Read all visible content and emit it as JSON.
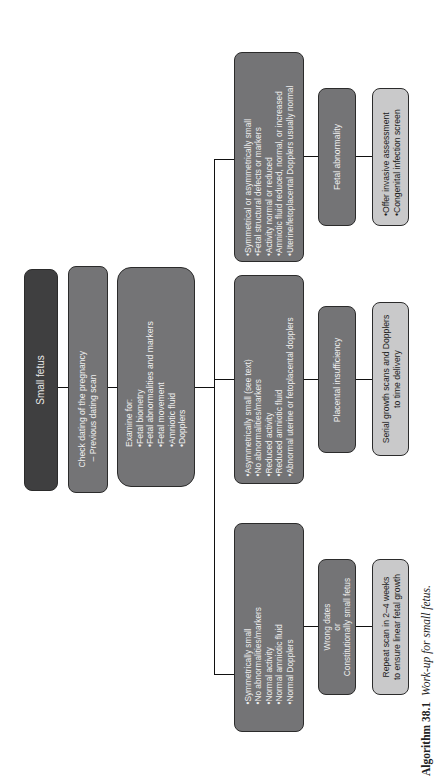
{
  "diagram": {
    "root": {
      "label": "Small fetus"
    },
    "step_check": {
      "title": "Check dating of the pregnancy",
      "detail": "– Previous dating scan"
    },
    "step_examine": {
      "title": "Examine for:",
      "items": [
        "Fetal biometry",
        "Fetal abnormalities and markers",
        "Fetal movement",
        "Amniotic fluid",
        "Dopplers"
      ]
    },
    "branches": [
      {
        "findings": [
          "Symmetrical or asymmetrically small",
          "Fetal structural defects or markers",
          "Activity normal or reduced",
          "Amniotic fluid reduced, normal, or increased",
          "Uterine/fetoplacental Dopplers usually normal"
        ],
        "diagnosis": {
          "line1": "Fetal abnormality",
          "line2": "",
          "line3": ""
        },
        "action": {
          "items": [
            "Offer invasive assessment",
            "Congenital infection screen"
          ]
        }
      },
      {
        "findings": [
          "Asymmetrically small (see text)",
          "No abnormalities/markers",
          "Reduced activity",
          "Reduced amniotic fluid",
          "Abnormal uterine or fetoplacental dopplers"
        ],
        "diagnosis": {
          "line1": "Placental insufficiency",
          "line2": "",
          "line3": ""
        },
        "action": {
          "line1": "Serial growth scans and Dopplers",
          "line2": "to time delivery"
        }
      },
      {
        "findings": [
          "Symmetrically small",
          "No abnormalities/markers",
          "Normal activity",
          "Normal amniotic fluid",
          "Normal Dopplers"
        ],
        "diagnosis": {
          "line1": "Wrong dates",
          "line2": "or",
          "line3": "Constitutionally small fetus"
        },
        "action": {
          "line1": "Repeat scan in 2–4 weeks",
          "line2": "to ensure linear fetal growth"
        }
      }
    ],
    "colors": {
      "dark": "#3f3f40",
      "mid": "#747476",
      "light": "#c9c9ca",
      "line": "#111111"
    }
  },
  "caption": {
    "label": "Algorithm 38.1",
    "text": "Work-up for small fetus."
  }
}
